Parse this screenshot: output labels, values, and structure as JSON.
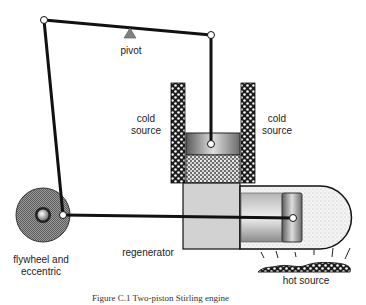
{
  "labels": {
    "pivot": "pivot",
    "cold_source_left_line1": "cold",
    "cold_source_left_line2": "source",
    "cold_source_right_line1": "cold",
    "cold_source_right_line2": "source",
    "flywheel_line1": "flywheel and",
    "flywheel_line2": "eccentric",
    "regenerator": "regenerator",
    "hot_source": "hot source"
  },
  "caption": "Figure C.1   Two-piston Stirling engine",
  "colors": {
    "linkage": "#111111",
    "joint_fill": "#ffffff",
    "pivot": "#7a7a7a",
    "cold_source": "#222222",
    "piston_grey": "#9a9a9a",
    "regenerator_fill": "#cfcfcf",
    "hot_gas": "#eeeeee",
    "flywheel": "#8a8a8a"
  }
}
